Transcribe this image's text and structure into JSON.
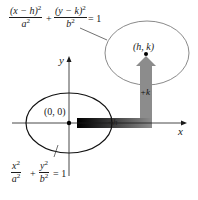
{
  "diagram": {
    "colors": {
      "axis": "#1a1a1a",
      "original_ellipse": "#111111",
      "translated_ellipse": "#8a8a8a",
      "h_arrow_start": "#000000",
      "h_arrow_end": "#8c8c8c",
      "k_arrow": "#8c8c8c"
    },
    "axes": {
      "x_label": "x",
      "y_label": "y"
    },
    "original_ellipse": {
      "center_label": "(0, 0)",
      "equation": {
        "term1_num": "x",
        "term1_num_exp": "2",
        "term1_den": "a",
        "term1_den_exp": "2",
        "plus": "+",
        "term2_num": "y",
        "term2_num_exp": "2",
        "term2_den": "b",
        "term2_den_exp": "2",
        "equals": "= 1"
      }
    },
    "translated_ellipse": {
      "center_label": "(h, k)",
      "equation": {
        "term1_num": "(x − h)",
        "term1_num_exp": "2",
        "term1_den": "a",
        "term1_den_exp": "2",
        "plus": "+",
        "term2_num": "(y − k)",
        "term2_num_exp": "2",
        "term2_den": "b",
        "term2_den_exp": "2",
        "equals": "= 1"
      }
    },
    "shift_labels": {
      "horizontal": "+h",
      "vertical": "+k"
    }
  }
}
